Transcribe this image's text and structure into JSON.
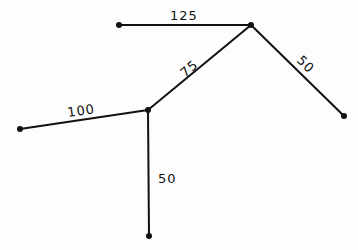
{
  "diagram": {
    "type": "weighted-tree",
    "nodes": [
      {
        "id": "A",
        "x": 119,
        "y": 25
      },
      {
        "id": "B",
        "x": 251,
        "y": 25
      },
      {
        "id": "C",
        "x": 344,
        "y": 116
      },
      {
        "id": "D",
        "x": 148,
        "y": 110
      },
      {
        "id": "E",
        "x": 20,
        "y": 129
      },
      {
        "id": "F",
        "x": 149,
        "y": 236
      }
    ],
    "edges": [
      {
        "from": "A",
        "to": "B",
        "weight": "125"
      },
      {
        "from": "B",
        "to": "C",
        "weight": "50"
      },
      {
        "from": "D",
        "to": "B",
        "weight": "75"
      },
      {
        "from": "E",
        "to": "D",
        "weight": "100"
      },
      {
        "from": "D",
        "to": "F",
        "weight": "50"
      }
    ]
  },
  "labels": {
    "ab": "125",
    "bc": "50",
    "db": "75",
    "ed": "100",
    "df": "50"
  }
}
